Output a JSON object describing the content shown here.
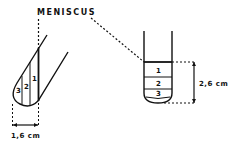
{
  "diagram": {
    "title_label": "MENISCUS",
    "tilted_tube": {
      "layers": [
        "1",
        "2",
        "3"
      ],
      "width_label": "1,6 cm"
    },
    "upright_tube": {
      "layers": [
        "1",
        "2",
        "3"
      ],
      "height_label": "2,6 cm"
    },
    "colors": {
      "ink": "#111111",
      "background": "#ffffff"
    }
  }
}
